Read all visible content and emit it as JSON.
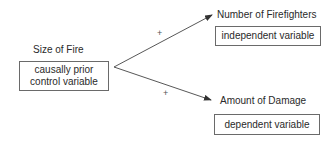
{
  "diagram": {
    "cause": {
      "title": "Size of Fire",
      "box_lines": [
        "causally prior",
        "control variable"
      ]
    },
    "upper": {
      "title": "Number of Firefighters",
      "box_label": "independent variable",
      "sign": "+"
    },
    "lower": {
      "title": "Amount of Damage",
      "box_label": "dependent variable",
      "sign": "+"
    },
    "colors": {
      "line": "#444444",
      "text": "#2a2a2a",
      "box_border": "#6a6a6a"
    }
  }
}
